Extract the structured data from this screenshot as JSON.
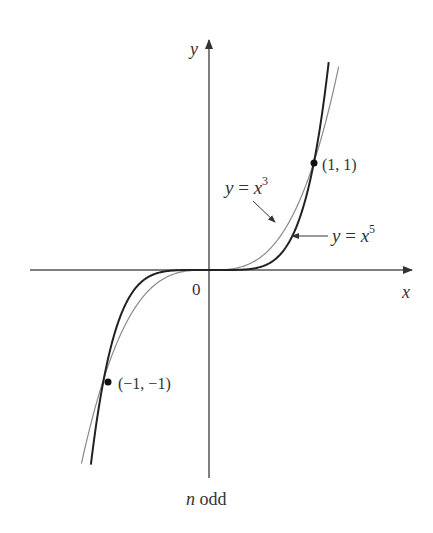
{
  "figure": {
    "caption_var": "n",
    "caption_rest": " odd",
    "axes": {
      "x_label": "x",
      "y_label": "y",
      "origin_label": "0"
    },
    "points": [
      {
        "label": "(1, 1)",
        "x": 1,
        "y": 1
      },
      {
        "label": "(−1, −1)",
        "x": -1,
        "y": -1
      }
    ],
    "curves": [
      {
        "name": "y = x^3",
        "label_base": "y = x",
        "exponent": "3",
        "stroke": "#8a8a8a",
        "width": 1.2
      },
      {
        "name": "y = x^5",
        "label_base": "y = x",
        "exponent": "5",
        "stroke": "#222222",
        "width": 2.0
      }
    ]
  },
  "chart_data": {
    "type": "line",
    "title": "",
    "caption": "n odd",
    "xlabel": "x",
    "ylabel": "y",
    "xlim": [
      -1.9,
      1.9
    ],
    "ylim": [
      -2.0,
      2.3
    ],
    "grid": false,
    "legend": "inline annotations with arrows",
    "series": [
      {
        "name": "y = x^3",
        "function": "x^3",
        "color": "#8a8a8a"
      },
      {
        "name": "y = x^5",
        "function": "x^5",
        "color": "#222222"
      }
    ],
    "annotations": [
      {
        "text": "(1, 1)",
        "x": 1,
        "y": 1
      },
      {
        "text": "(−1, −1)",
        "x": -1,
        "y": -1
      },
      {
        "text": "0",
        "x": 0,
        "y": 0
      }
    ]
  }
}
